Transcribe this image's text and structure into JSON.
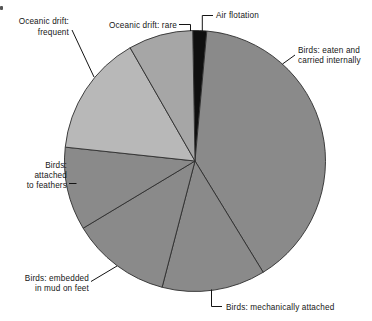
{
  "canvas": {
    "width": 372,
    "height": 321,
    "background": "#ffffff"
  },
  "chart_data": {
    "type": "pie",
    "title": "",
    "legend": "none (direct labels with leader lines)",
    "angle_convention": "degrees clockwise from 12 o'clock",
    "center_x": 195,
    "center_y": 161,
    "radius": 130.5,
    "slice_border_color": "#2e2e2e",
    "leader_color": "#141414",
    "text_color": "#161616",
    "slices": [
      {
        "label": "Air flotation",
        "percent": 2,
        "start_angle": -1.0,
        "end_angle": 5.2,
        "color": "#0f0f0f",
        "annotation": {
          "lines": [
            "Air flotation"
          ],
          "x": 216,
          "y": 18,
          "line_height": 10,
          "anchor": "start",
          "leader": [
            [
              213,
              15.5
            ],
            [
              202.3,
              15.5
            ],
            [
              202.3,
              31
            ]
          ]
        }
      },
      {
        "label": "Birds: eaten and carried internally",
        "percent": 40,
        "start_angle": 5.2,
        "end_angle": 148.5,
        "color": "#8a8a8a",
        "annotation": {
          "lines": [
            "Birds: eaten and",
            "carried internally"
          ],
          "x": 298,
          "y": 53,
          "line_height": 10,
          "anchor": "start",
          "leader": [
            [
              295,
              55
            ],
            [
              282.5,
              64
            ]
          ]
        }
      },
      {
        "label": "Birds: mechanically attached",
        "percent": 13,
        "start_angle": 148.5,
        "end_angle": 194.6,
        "color": "#8a8a8a",
        "annotation": {
          "lines": [
            "Birds: mechanically attached"
          ],
          "x": 226,
          "y": 310,
          "line_height": 10,
          "anchor": "start",
          "leader": [
            [
              222,
              306.5
            ],
            [
              211.5,
              306.5
            ],
            [
              211.5,
              289.5
            ]
          ]
        }
      },
      {
        "label": "Birds: embedded in mud on feet",
        "percent": 12,
        "start_angle": 194.6,
        "end_angle": 239.0,
        "color": "#8a8a8a",
        "annotation": {
          "lines": [
            "Birds: embedded",
            "in mud on feet"
          ],
          "x": 89,
          "y": 281,
          "line_height": 10,
          "anchor": "end",
          "leader": [
            [
              91,
              281.5
            ],
            [
              117,
              266
            ]
          ]
        }
      },
      {
        "label": "Birds: attached to feathers",
        "percent": 10,
        "start_angle": 239.0,
        "end_angle": 276.1,
        "color": "#8a8a8a",
        "annotation": {
          "lines": [
            "Birds:",
            "attached",
            "to feathers"
          ],
          "x": 67,
          "y": 168,
          "line_height": 10,
          "anchor": "end",
          "leader": [
            [
              69,
              183.5
            ],
            [
              76.5,
              183.5
            ]
          ]
        }
      },
      {
        "label": "Oceanic drift: frequent",
        "percent": 15,
        "start_angle": 276.1,
        "end_angle": 330.2,
        "color": "#b8b8b8",
        "annotation": {
          "lines": [
            "Oceanic drift:",
            "frequent"
          ],
          "x": 69,
          "y": 24,
          "line_height": 10.5,
          "anchor": "end",
          "leader": [
            [
              72,
              30
            ],
            [
              94,
              77
            ]
          ]
        }
      },
      {
        "label": "Oceanic drift: rare",
        "percent": 8,
        "start_angle": 330.2,
        "end_angle": 359.0,
        "color": "#a6a6a6",
        "annotation": {
          "lines": [
            "Oceanic drift: rare"
          ],
          "x": 177,
          "y": 28,
          "line_height": 10,
          "anchor": "end",
          "leader": [
            [
              179,
              24.5
            ],
            [
              190.5,
              24.5
            ],
            [
              190.5,
              31
            ]
          ]
        }
      }
    ]
  }
}
